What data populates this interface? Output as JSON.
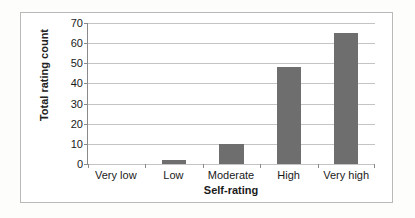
{
  "chart_data": {
    "type": "bar",
    "title": "",
    "xlabel": "Self-rating",
    "ylabel": "Total rating count",
    "categories": [
      "Very low",
      "Low",
      "Moderate",
      "High",
      "Very high"
    ],
    "values": [
      0,
      2,
      10,
      48,
      65
    ],
    "ylim": [
      0,
      70
    ],
    "ytick_step": 10,
    "yticks": [
      0,
      10,
      20,
      30,
      40,
      50,
      60,
      70
    ],
    "ytick_labels": [
      "0",
      "10",
      "20",
      "30",
      "40",
      "50",
      "60",
      "70"
    ],
    "grid": "horizontal",
    "legend": "none",
    "bar_color": "#6e6e6e",
    "gridline_color": "#c4c4c4",
    "axis_color": "#8a8a8a",
    "frame_color": "#b9b9b9"
  }
}
